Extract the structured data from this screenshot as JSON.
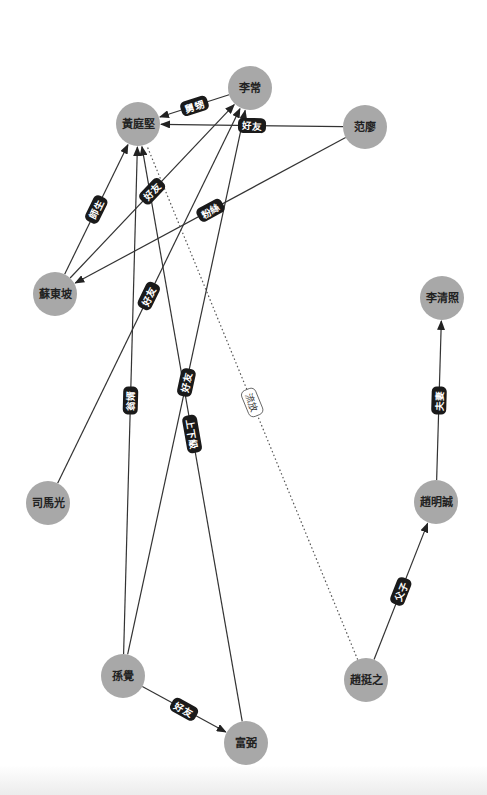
{
  "graph": {
    "title": "",
    "node_color": "#a8a8a8",
    "edge_color": "#333333",
    "label_bg_color": "#1a1a1a",
    "nodes": [
      {
        "id": "lichang",
        "label": "李常",
        "x": 250,
        "y": 88
      },
      {
        "id": "huangtingjian",
        "label": "黃庭堅",
        "x": 138,
        "y": 124
      },
      {
        "id": "fanliao",
        "label": "范廖",
        "x": 365,
        "y": 127
      },
      {
        "id": "sudongpo",
        "label": "蘇東坡",
        "x": 55,
        "y": 294
      },
      {
        "id": "liqingzhao",
        "label": "李清照",
        "x": 442,
        "y": 298
      },
      {
        "id": "simaguang",
        "label": "司馬光",
        "x": 48,
        "y": 503
      },
      {
        "id": "zhaomingcheng",
        "label": "趙明誠",
        "x": 436,
        "y": 502
      },
      {
        "id": "sunjue",
        "label": "孫覺",
        "x": 123,
        "y": 676
      },
      {
        "id": "zhaotingzhi",
        "label": "趙挺之",
        "x": 366,
        "y": 680
      },
      {
        "id": "fubi",
        "label": "富弼",
        "x": 246,
        "y": 743
      }
    ],
    "edges": [
      {
        "from": "lichang",
        "to": "huangtingjian",
        "label": "舅甥",
        "style": "solid"
      },
      {
        "from": "fanliao",
        "to": "huangtingjian",
        "label": "好友",
        "style": "solid"
      },
      {
        "from": "sudongpo",
        "to": "huangtingjian",
        "label": "師生",
        "style": "solid"
      },
      {
        "from": "sudongpo",
        "to": "lichang",
        "label": "好友",
        "style": "solid"
      },
      {
        "from": "fanliao",
        "to": "sudongpo",
        "label": "粉絲",
        "style": "solid"
      },
      {
        "from": "simaguang",
        "to": "lichang",
        "label": "好友",
        "style": "solid"
      },
      {
        "from": "sunjue",
        "to": "huangtingjian",
        "label": "翁婿",
        "style": "solid"
      },
      {
        "from": "sunjue",
        "to": "lichang",
        "label": "好友",
        "style": "solid"
      },
      {
        "from": "fubi",
        "to": "huangtingjian",
        "label": "上下級",
        "style": "solid"
      },
      {
        "from": "zhaotingzhi",
        "to": "huangtingjian",
        "label": "流放",
        "style": "dotted"
      },
      {
        "from": "zhaomingcheng",
        "to": "liqingzhao",
        "label": "夫妻",
        "style": "solid"
      },
      {
        "from": "zhaotingzhi",
        "to": "zhaomingcheng",
        "label": "父子",
        "style": "solid"
      },
      {
        "from": "sunjue",
        "to": "fubi",
        "label": "好友",
        "style": "solid"
      }
    ]
  }
}
